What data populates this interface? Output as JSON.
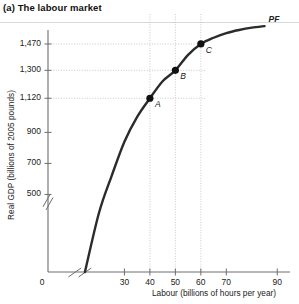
{
  "panel": {
    "title": "(a) The labour market"
  },
  "chart_data": {
    "type": "line",
    "title": "(a) The labour market",
    "xlabel": "Labour (billions of hours per year)",
    "ylabel": "Real GDP (billions of 2005 pounds)",
    "curve_label": "PF",
    "xlim": [
      0,
      95
    ],
    "ylim": [
      0,
      1560
    ],
    "grid": true,
    "legend": "none",
    "axis_break": {
      "x": true,
      "y": true
    },
    "xticks": [
      {
        "value": 0,
        "label": "0"
      },
      {
        "value": 30,
        "label": "30"
      },
      {
        "value": 40,
        "label": "40"
      },
      {
        "value": 50,
        "label": "50"
      },
      {
        "value": 60,
        "label": "60"
      },
      {
        "value": 70,
        "label": "70"
      },
      {
        "value": 90,
        "label": "90"
      }
    ],
    "yticks": [
      {
        "value": 500,
        "label": "500"
      },
      {
        "value": 700,
        "label": "700"
      },
      {
        "value": 900,
        "label": "900"
      },
      {
        "value": 1120,
        "label": "1,120"
      },
      {
        "value": 1300,
        "label": "1,300"
      },
      {
        "value": 1470,
        "label": "1,470"
      }
    ],
    "gridline_values": {
      "horizontal": [
        1120,
        1300,
        1470
      ],
      "vertical": [
        40,
        50,
        60
      ]
    },
    "series": [
      {
        "name": "PF",
        "points": [
          {
            "x": 20,
            "y": 380
          },
          {
            "x": 25,
            "y": 620
          },
          {
            "x": 30,
            "y": 840
          },
          {
            "x": 35,
            "y": 1000
          },
          {
            "x": 40,
            "y": 1120
          },
          {
            "x": 45,
            "y": 1230
          },
          {
            "x": 50,
            "y": 1300
          },
          {
            "x": 55,
            "y": 1400
          },
          {
            "x": 60,
            "y": 1470
          },
          {
            "x": 65,
            "y": 1510
          },
          {
            "x": 70,
            "y": 1540
          },
          {
            "x": 75,
            "y": 1560
          },
          {
            "x": 80,
            "y": 1575
          },
          {
            "x": 85,
            "y": 1585
          }
        ]
      }
    ],
    "annotations": [
      {
        "label": "A",
        "x": 40,
        "y": 1120
      },
      {
        "label": "B",
        "x": 50,
        "y": 1300
      },
      {
        "label": "C",
        "x": 60,
        "y": 1470
      }
    ]
  }
}
